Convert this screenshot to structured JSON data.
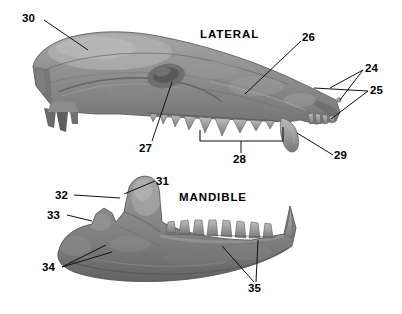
{
  "figure": {
    "kind": "anatomical-photo-plate",
    "background_color": "#ffffff",
    "bone_color": "#8d8d8d",
    "line_color": "#111111"
  },
  "titles": {
    "upper": "LATERAL",
    "lower": "MANDIBLE"
  },
  "labels": [
    {
      "id": "24",
      "text": "24"
    },
    {
      "id": "25",
      "text": "25"
    },
    {
      "id": "26",
      "text": "26"
    },
    {
      "id": "27",
      "text": "27"
    },
    {
      "id": "28",
      "text": "28"
    },
    {
      "id": "29",
      "text": "29"
    },
    {
      "id": "30",
      "text": "30"
    },
    {
      "id": "31",
      "text": "31"
    },
    {
      "id": "32",
      "text": "32"
    },
    {
      "id": "33",
      "text": "33"
    },
    {
      "id": "34",
      "text": "34"
    },
    {
      "id": "35",
      "text": "35"
    }
  ]
}
